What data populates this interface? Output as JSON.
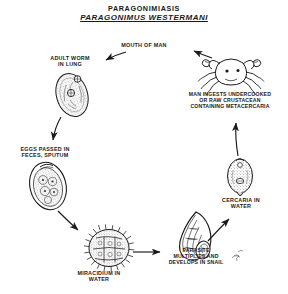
{
  "title": {
    "disease": "PARAGONIMIASIS",
    "organism": "PARAGONIMUS WESTERMANI"
  },
  "diagram": {
    "type": "life-cycle",
    "background_color": "#ffffff",
    "ink_color": "#1a1a1a",
    "signature": "artist-signature-mark"
  },
  "stages": [
    {
      "id": "mouth-of-man",
      "label": "MOUTH OF MAN",
      "illustration": "none",
      "x": 144,
      "y": 47
    },
    {
      "id": "adult-worm",
      "label": "ADULT WORM\nIN LUNG",
      "label_lines": [
        "ADULT WORM",
        "IN  LUNG"
      ],
      "illustration": "adult-fluke-oval",
      "x": 70,
      "y": 63
    },
    {
      "id": "eggs",
      "label": "EGGS PASSED IN\nFECES, SPUTUM",
      "label_lines": [
        "EGGS PASSED  IN",
        "FECES, SPUTUM"
      ],
      "illustration": "operculated-egg",
      "x": 44,
      "y": 152
    },
    {
      "id": "miracidium",
      "label": "MIRACIDIUM IN\nWATER",
      "label_lines": [
        "MIRACIDIUM  IN",
        "WATER"
      ],
      "illustration": "ciliated-miracidium",
      "x": 98,
      "y": 276
    },
    {
      "id": "snail",
      "label": "PARASITE\nMULTIPLIES AND\nDEVELOPS IN SNAIL",
      "label_lines": [
        "PARASITE",
        "MULTIPLIES AND",
        "DEVELOPS IN SNAIL"
      ],
      "illustration": "snail-shell",
      "x": 196,
      "y": 256
    },
    {
      "id": "cercaria",
      "label": "CERCARIA IN\nWATER",
      "label_lines": [
        "CERCARIA  IN",
        "WATER"
      ],
      "illustration": "cercaria-larva",
      "x": 240,
      "y": 203
    },
    {
      "id": "crab",
      "label": "MAN INGESTS UNDERCOOKED\nOR RAW CRUSTACEAN\nCONTAINING METACERCARIA",
      "label_lines": [
        "MAN INGESTS UNDERCOOKED",
        "OR RAW CRUSTACEAN",
        "CONTAINING METACERCARIA"
      ],
      "illustration": "crab-crustacean",
      "x": 231,
      "y": 101
    }
  ],
  "arrows": [
    {
      "from": "mouth-of-man",
      "to": "adult-worm",
      "direction": "down-left"
    },
    {
      "from": "adult-worm",
      "to": "eggs",
      "direction": "down"
    },
    {
      "from": "eggs",
      "to": "miracidium",
      "direction": "down-right"
    },
    {
      "from": "miracidium",
      "to": "snail",
      "direction": "right"
    },
    {
      "from": "snail",
      "to": "cercaria",
      "direction": "up-right"
    },
    {
      "from": "cercaria",
      "to": "crab",
      "direction": "up"
    },
    {
      "from": "crab",
      "to": "mouth-of-man",
      "direction": "up-left"
    }
  ]
}
